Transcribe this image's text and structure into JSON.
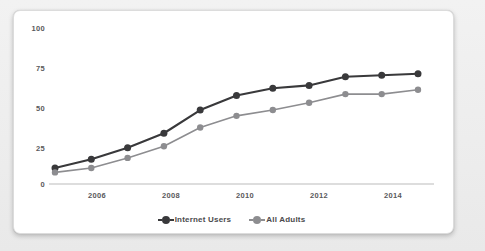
{
  "chart_data": {
    "type": "line",
    "title": "",
    "xlabel": "",
    "ylabel": "",
    "x": [
      2005,
      2006,
      2007,
      2008,
      2009,
      2010,
      2011,
      2012,
      2013,
      2014,
      2015
    ],
    "categories": [
      "2005",
      "2006",
      "2007",
      "2008",
      "2009",
      "2010",
      "2011",
      "2012",
      "2013",
      "2014",
      "2015"
    ],
    "series": [
      {
        "name": "Internet Users",
        "color": "#39393b",
        "values": [
          11,
          17,
          25,
          35,
          51,
          61,
          66,
          68,
          74,
          75,
          76
        ]
      },
      {
        "name": "All Adults",
        "color": "#8d8d90",
        "values": [
          8,
          11,
          18,
          26,
          39,
          47,
          51,
          56,
          62,
          62,
          65
        ]
      }
    ],
    "ylim": [
      0,
      100
    ],
    "xlim": [
      2005,
      2015
    ],
    "y_ticks": [
      0,
      25,
      50,
      75,
      100
    ],
    "y_tick_labels": [
      "0",
      "25",
      "50",
      "75",
      "100"
    ],
    "x_ticks": [
      2006,
      2008,
      2010,
      2012,
      2014
    ],
    "x_tick_labels": [
      "2006",
      "2008",
      "2010",
      "2012",
      "2014"
    ],
    "grid": false,
    "legend_position": "bottom"
  },
  "legend": {
    "items": [
      {
        "label": "Internet Users",
        "color": "#39393b"
      },
      {
        "label": "All Adults",
        "color": "#8d8d90"
      }
    ]
  },
  "colors": {
    "card_background": "#ffffff",
    "page_background": "#eeeeee",
    "axis": "#cfcfcf",
    "tick_text": "#59595b",
    "series_internet_users": "#39393b",
    "series_all_adults": "#8d8d90"
  }
}
